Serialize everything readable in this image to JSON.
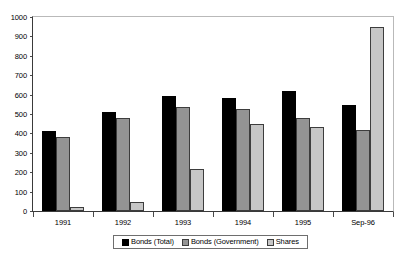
{
  "chart_data": {
    "type": "bar",
    "title": "",
    "xlabel": "",
    "ylabel": "",
    "categories": [
      "1991",
      "1992",
      "1993",
      "1994",
      "1995",
      "Sep-96"
    ],
    "series": [
      {
        "name": "Bonds (Total)",
        "color": "#000000",
        "values": [
          415,
          512,
          595,
          580,
          620,
          545
        ]
      },
      {
        "name": "Bonds (Government)",
        "color": "#949494",
        "values": [
          380,
          478,
          535,
          528,
          482,
          420
        ]
      },
      {
        "name": "Shares",
        "color": "#c6c6c6",
        "values": [
          20,
          45,
          215,
          450,
          432,
          950
        ]
      }
    ],
    "ylim": [
      0,
      1000
    ],
    "yticks": [
      0,
      100,
      200,
      300,
      400,
      500,
      600,
      700,
      800,
      900,
      1000
    ],
    "ytick_labels": [
      "0",
      "100",
      "200",
      "300",
      "400",
      "500",
      "600",
      "700",
      "800",
      "900",
      "1000"
    ],
    "grid": false,
    "legend_position": "bottom"
  }
}
